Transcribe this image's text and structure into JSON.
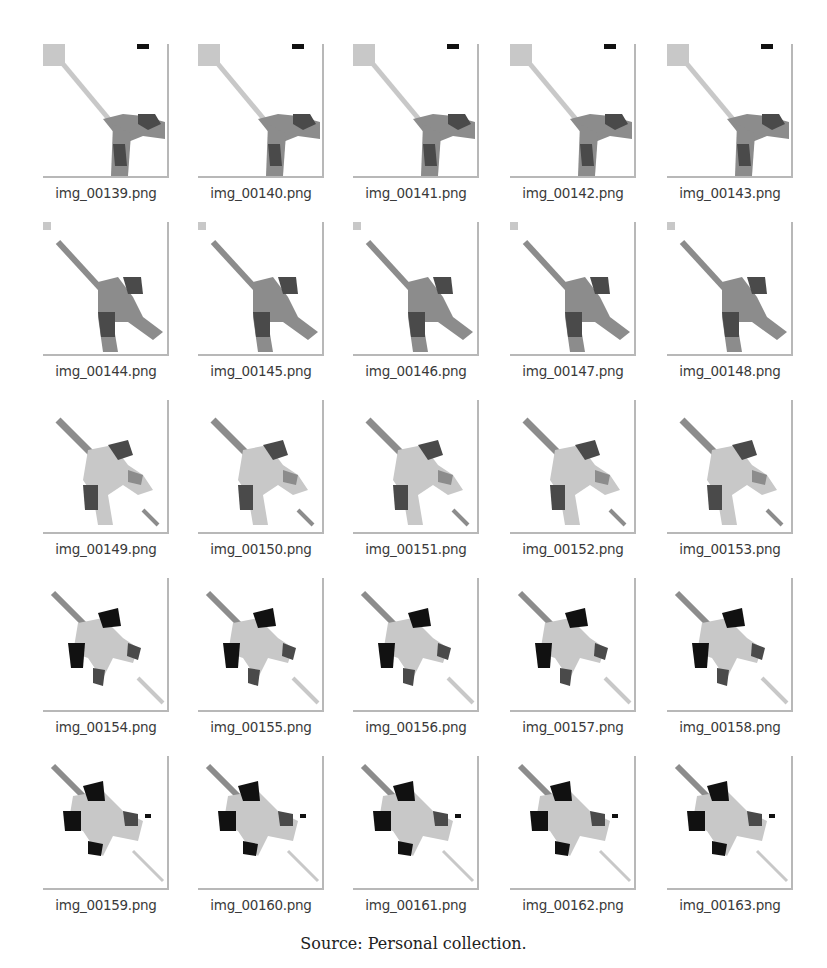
{
  "file_grid": {
    "rows": [
      {
        "items": [
          {
            "filename": "img_00139.png",
            "stage": 0
          },
          {
            "filename": "img_00140.png",
            "stage": 0
          },
          {
            "filename": "img_00141.png",
            "stage": 0
          },
          {
            "filename": "img_00142.png",
            "stage": 0
          },
          {
            "filename": "img_00143.png",
            "stage": 0
          }
        ]
      },
      {
        "items": [
          {
            "filename": "img_00144.png",
            "stage": 1
          },
          {
            "filename": "img_00145.png",
            "stage": 1
          },
          {
            "filename": "img_00146.png",
            "stage": 1
          },
          {
            "filename": "img_00147.png",
            "stage": 1
          },
          {
            "filename": "img_00148.png",
            "stage": 1
          }
        ]
      },
      {
        "items": [
          {
            "filename": "img_00149.png",
            "stage": 2
          },
          {
            "filename": "img_00150.png",
            "stage": 2
          },
          {
            "filename": "img_00151.png",
            "stage": 2
          },
          {
            "filename": "img_00152.png",
            "stage": 2
          },
          {
            "filename": "img_00153.png",
            "stage": 2
          }
        ]
      },
      {
        "items": [
          {
            "filename": "img_00154.png",
            "stage": 3
          },
          {
            "filename": "img_00155.png",
            "stage": 3
          },
          {
            "filename": "img_00156.png",
            "stage": 3
          },
          {
            "filename": "img_00157.png",
            "stage": 3
          },
          {
            "filename": "img_00158.png",
            "stage": 3
          }
        ]
      },
      {
        "items": [
          {
            "filename": "img_00159.png",
            "stage": 4
          },
          {
            "filename": "img_00160.png",
            "stage": 4
          },
          {
            "filename": "img_00161.png",
            "stage": 4
          },
          {
            "filename": "img_00162.png",
            "stage": 4
          },
          {
            "filename": "img_00163.png",
            "stage": 4
          }
        ]
      }
    ]
  },
  "caption": "Source: Personal collection.",
  "colors": {
    "light_gray": "#c8c8c8",
    "mid_gray": "#8c8c8c",
    "dark_gray": "#4a4a4a",
    "black": "#111111",
    "border": "#b8b8b8"
  }
}
